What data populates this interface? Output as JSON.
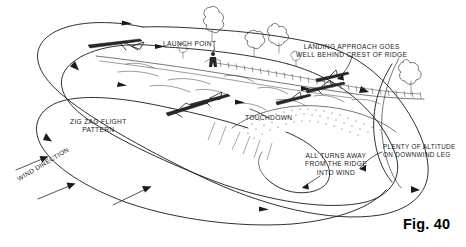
{
  "figure": {
    "number_label": "Fig. 40",
    "background_color": "#ffffff",
    "ink_color": "#1a1a1e"
  },
  "annotations": {
    "launch_point": "LAUNCH POINT",
    "landing_approach_line1": "LANDING APPROACH GOES",
    "landing_approach_line2": "WELL BEHIND CREST OF RIDGE",
    "zigzag_line1": "ZIG ZAG FLIGHT",
    "zigzag_line2": "PATTERN",
    "touchdown": "TOUCHDOWN",
    "all_turns_line1": "ALL TURNS AWAY",
    "all_turns_line2": "FROM THE RIDGE",
    "all_turns_line3": "INTO WIND",
    "plenty_altitude_line1": "PLENTY OF ALTITUDE",
    "plenty_altitude_line2": "ON DOWNWIND LEG",
    "wind_direction": "WIND DIRECTION"
  },
  "scene_elements": {
    "pilot_figure": "standing-pilot-at-launch-point",
    "trees": "hand-drawn-outline-trees-along-ridge",
    "ridge": "ridge-crest-with-fence-line",
    "hill": "stippled-hill-slope-below-touchdown",
    "gliders": "glider-silhouettes-on-flight-path",
    "flight_path": "nested-elongated-loops-with-direction-arrows",
    "wind_arrows": "three-arrows-indicating-wind-up-the-slope"
  }
}
